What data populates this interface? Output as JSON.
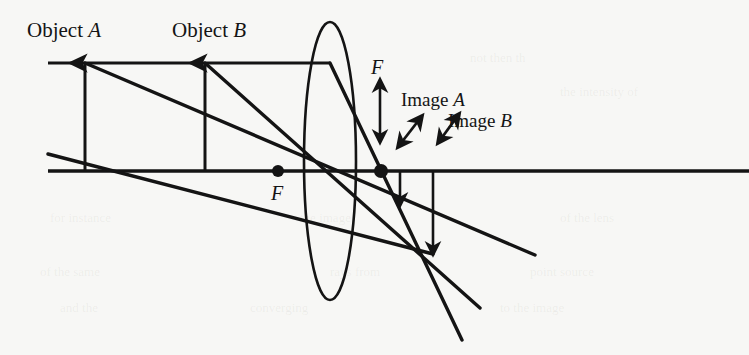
{
  "figure": {
    "kind": "optics-ray-diagram",
    "background_color": "#f7f7f5",
    "ink_color": "#141414",
    "width": 749,
    "height": 355
  },
  "labels": {
    "object_a": {
      "text": "Object",
      "italic_suffix": "A"
    },
    "object_b": {
      "text": "Object",
      "italic_suffix": "B"
    },
    "image_a": {
      "text": "Image",
      "italic_suffix": "A"
    },
    "image_b": {
      "text": "Image",
      "italic_suffix": "B"
    },
    "focal_left": "F",
    "focal_right": "F"
  },
  "geometry": {
    "optical_axis": {
      "x1": 48,
      "y1": 171,
      "x2": 749,
      "y2": 171
    },
    "top_ray_line": {
      "x1": 48,
      "y1": 63,
      "x2": 330,
      "y2": 63
    },
    "lens": {
      "cx": 330,
      "cy": 161,
      "rx": 26,
      "ry": 139
    },
    "object_a_arrow": {
      "x": 85,
      "y_base": 171,
      "y_tip": 63
    },
    "object_b_arrow": {
      "x": 205,
      "y_base": 171,
      "y_tip": 63
    },
    "focal_point_left": {
      "x": 278,
      "y": 171,
      "r": 6
    },
    "focal_point_right": {
      "x": 381,
      "y": 171,
      "r": 7
    },
    "image_a_arrow": {
      "x": 400,
      "y_base": 171,
      "y_tip": 205
    },
    "image_b_arrow": {
      "x": 433,
      "y_base": 171,
      "y_tip": 254
    },
    "focal_measure_arrow": {
      "x": 380,
      "y_top": 80,
      "y_bottom": 142
    },
    "pointer_arrow_a": {
      "x1": 398,
      "y1": 147,
      "x2": 422,
      "y2": 116
    },
    "pointer_arrow_b": {
      "x1": 438,
      "y1": 143,
      "x2": 459,
      "y2": 114
    },
    "rays": [
      {
        "name": "ray-object-a-through-center",
        "x1": 85,
        "y1": 63,
        "x2": 535,
        "y2": 255
      },
      {
        "name": "ray-object-b-through-center",
        "x1": 205,
        "y1": 63,
        "x2": 480,
        "y2": 308
      },
      {
        "name": "ray-parallel-refracted",
        "x1": 330,
        "y1": 63,
        "x2": 462,
        "y2": 340
      },
      {
        "name": "ray-lower-left-segment",
        "x1": 48,
        "y1": 154,
        "x2": 433,
        "y2": 254
      }
    ]
  },
  "bleed_through": [
    {
      "text": "not then th",
      "x": 470,
      "y": 62
    },
    {
      "text": "the intensity of",
      "x": 560,
      "y": 96
    },
    {
      "text": "for instance",
      "x": 50,
      "y": 222
    },
    {
      "text": "the image",
      "x": 300,
      "y": 222
    },
    {
      "text": "of the lens",
      "x": 560,
      "y": 222
    },
    {
      "text": "of the same",
      "x": 40,
      "y": 276
    },
    {
      "text": "rays from",
      "x": 330,
      "y": 276
    },
    {
      "text": "point source",
      "x": 530,
      "y": 276
    },
    {
      "text": "and the",
      "x": 60,
      "y": 312
    },
    {
      "text": "converging",
      "x": 250,
      "y": 312
    },
    {
      "text": "to the image",
      "x": 500,
      "y": 312
    }
  ]
}
